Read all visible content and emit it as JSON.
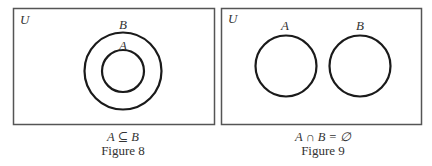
{
  "figures": [
    {
      "id": "figure-8",
      "universe_label": "U",
      "sets": [
        {
          "label": "B",
          "role": "outer"
        },
        {
          "label": "A",
          "role": "inner"
        }
      ],
      "relation": "A ⊆ B",
      "caption": "Figure 8"
    },
    {
      "id": "figure-9",
      "universe_label": "U",
      "sets": [
        {
          "label": "A",
          "role": "left"
        },
        {
          "label": "B",
          "role": "right"
        }
      ],
      "relation": "A ∩ B = ∅",
      "caption": "Figure 9"
    }
  ],
  "colors": {
    "stroke": "#1a1a1a",
    "box": "#555555",
    "background": "#ffffff"
  }
}
